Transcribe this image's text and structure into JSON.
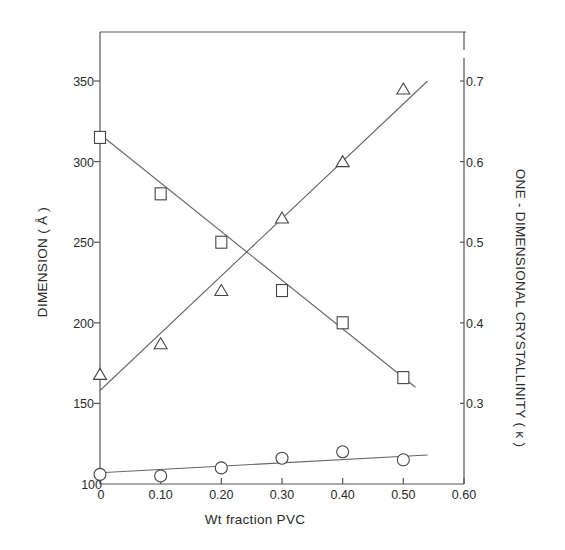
{
  "chart_data": {
    "type": "scatter",
    "title": "",
    "xlabel": "Wt fraction PVC",
    "ylabel": "DIMENSION ( Å )",
    "y2label": "ONE - DIMENSIONAL  CRYSTALLINITY ( κ )",
    "xlim": [
      0,
      0.6
    ],
    "ylim": [
      100,
      375
    ],
    "y2lim": [
      0.2,
      0.75
    ],
    "grid": false,
    "legend": null,
    "x_ticks": [
      0,
      0.1,
      0.2,
      0.3,
      0.4,
      0.5,
      0.6
    ],
    "x_tick_labels": [
      "0",
      "0.10",
      "0.20",
      "0.30",
      "0.40",
      "0.50",
      "0.60"
    ],
    "y_ticks": [
      100,
      150,
      200,
      250,
      300,
      350
    ],
    "y_tick_labels": [
      "100",
      "150",
      "200",
      "250",
      "300",
      "350"
    ],
    "y2_ticks": [
      0.3,
      0.4,
      0.5,
      0.6,
      0.7
    ],
    "y2_tick_labels": [
      "0.3",
      "0.4",
      "0.5",
      "0.6",
      "0.7"
    ],
    "series": [
      {
        "name": "squares",
        "marker": "square",
        "axis": "left",
        "x": [
          0,
          0.1,
          0.2,
          0.3,
          0.4,
          0.5
        ],
        "values": [
          315,
          280,
          250,
          220,
          200,
          166
        ],
        "fit_line": {
          "x": [
            0,
            0.52
          ],
          "y": [
            317,
            160
          ]
        }
      },
      {
        "name": "triangles",
        "marker": "triangle",
        "axis": "right",
        "x": [
          0,
          0.1,
          0.2,
          0.3,
          0.4,
          0.5
        ],
        "values": [
          168,
          187,
          220,
          265,
          300,
          345
        ],
        "values_right_axis": [
          0.336,
          0.374,
          0.44,
          0.53,
          0.6,
          0.69
        ],
        "fit_line": {
          "x": [
            0,
            0.54
          ],
          "y": [
            158,
            350
          ]
        }
      },
      {
        "name": "circles",
        "marker": "circle",
        "axis": "left",
        "x": [
          0,
          0.1,
          0.2,
          0.3,
          0.4,
          0.5
        ],
        "values": [
          106,
          105,
          110,
          116,
          120,
          115
        ],
        "fit_line": {
          "x": [
            0,
            0.54
          ],
          "y": [
            107,
            118
          ]
        }
      }
    ]
  }
}
